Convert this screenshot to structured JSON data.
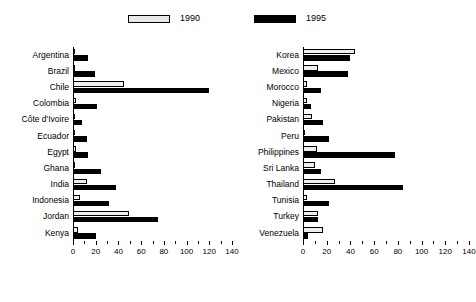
{
  "legend": {
    "entries": [
      {
        "label": "1990",
        "swatch": "light-bar-swatch",
        "color": "#eeeeee"
      },
      {
        "label": "1995",
        "swatch": "dark-bar-swatch",
        "color": "#000000"
      }
    ]
  },
  "chart_data": [
    {
      "id": "left",
      "type": "bar",
      "orientation": "horizontal",
      "title": "",
      "xlabel": "",
      "ylabel": "",
      "xlim": [
        0,
        140
      ],
      "xticks": [
        0,
        20,
        40,
        60,
        80,
        100,
        120,
        140
      ],
      "xtick_labels": [
        "0",
        "20",
        "40",
        "60",
        "80",
        "100",
        "120",
        "140"
      ],
      "minor_tick_step": 10,
      "grid": false,
      "legend_position": "top",
      "categories": [
        "Argentina",
        "Brazil",
        "Chile",
        "Colombia",
        "Côte d'Ivoire",
        "Ecuador",
        "Egypt",
        "Ghana",
        "India",
        "Indonesia",
        "Jordan",
        "Kenya"
      ],
      "series": [
        {
          "name": "1990",
          "values": [
            2,
            2,
            45,
            3,
            2,
            0,
            3,
            0.5,
            12,
            6,
            49,
            4
          ]
        },
        {
          "name": "1995",
          "values": [
            13,
            19,
            120,
            21,
            8,
            12,
            13,
            25,
            38,
            32,
            75,
            20
          ]
        }
      ]
    },
    {
      "id": "right",
      "type": "bar",
      "orientation": "horizontal",
      "title": "",
      "xlabel": "",
      "ylabel": "",
      "xlim": [
        0,
        140
      ],
      "xticks": [
        0,
        20,
        40,
        60,
        80,
        100,
        120,
        140
      ],
      "xtick_labels": [
        "0",
        "20",
        "40",
        "60",
        "80",
        "100",
        "120",
        "140"
      ],
      "minor_tick_step": 10,
      "grid": false,
      "legend_position": "top",
      "categories": [
        "Korea",
        "Mexico",
        "Morocco",
        "Nigeria",
        "Pakistan",
        "Peru",
        "Philippines",
        "Sri Lanka",
        "Thailand",
        "Tunisia",
        "Turkey",
        "Venezuela"
      ],
      "series": [
        {
          "name": "1990",
          "values": [
            44,
            13,
            3,
            3,
            8,
            2,
            12,
            10,
            27,
            3,
            13,
            17
          ]
        },
        {
          "name": "1995",
          "values": [
            40,
            38,
            15,
            7,
            17,
            22,
            78,
            15,
            84,
            22,
            13,
            4
          ]
        }
      ]
    }
  ]
}
